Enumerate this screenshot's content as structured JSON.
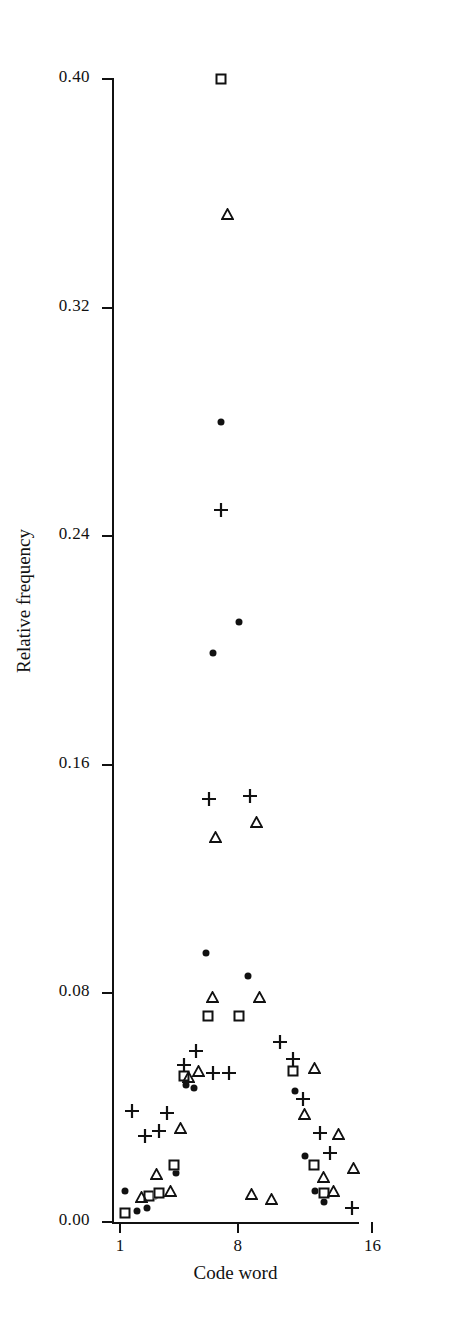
{
  "chart_data": {
    "type": "scatter",
    "title": "",
    "xlabel": "Code word",
    "ylabel": "Relative frequency",
    "xlim": [
      0,
      20
    ],
    "ylim": [
      0.0,
      0.4
    ],
    "grid": false,
    "legend": "none",
    "x_ticks": [
      {
        "value": 1,
        "label": "1"
      },
      {
        "value": 8,
        "label": "8"
      },
      {
        "value": 16,
        "label": "16"
      }
    ],
    "y_ticks": [
      {
        "value": 0.0,
        "label": "0.00"
      },
      {
        "value": 0.08,
        "label": "0.08"
      },
      {
        "value": 0.16,
        "label": "0.16"
      },
      {
        "value": 0.24,
        "label": "0.24"
      },
      {
        "value": 0.32,
        "label": "0.32"
      },
      {
        "value": 0.4,
        "label": "0.40"
      }
    ],
    "marker_types": [
      "circle",
      "square",
      "triangle",
      "plus"
    ],
    "series": [
      {
        "name": "circle",
        "marker": "circle",
        "color": "#111111",
        "points": [
          {
            "x": 1.3,
            "y": 0.011
          },
          {
            "x": 2.0,
            "y": 0.004
          },
          {
            "x": 2.6,
            "y": 0.005
          },
          {
            "x": 3.1,
            "y": 0.009
          },
          {
            "x": 4.3,
            "y": 0.017
          },
          {
            "x": 4.9,
            "y": 0.048
          },
          {
            "x": 5.4,
            "y": 0.047
          },
          {
            "x": 6.1,
            "y": 0.094
          },
          {
            "x": 6.5,
            "y": 0.199
          },
          {
            "x": 7.0,
            "y": 0.28
          },
          {
            "x": 8.1,
            "y": 0.21
          },
          {
            "x": 8.6,
            "y": 0.086
          },
          {
            "x": 11.4,
            "y": 0.046
          },
          {
            "x": 12.0,
            "y": 0.023
          },
          {
            "x": 12.6,
            "y": 0.011
          },
          {
            "x": 13.1,
            "y": 0.007
          }
        ]
      },
      {
        "name": "square",
        "marker": "square",
        "color": "#111111",
        "points": [
          {
            "x": 1.3,
            "y": 0.003
          },
          {
            "x": 2.7,
            "y": 0.009
          },
          {
            "x": 3.3,
            "y": 0.01
          },
          {
            "x": 4.2,
            "y": 0.02
          },
          {
            "x": 4.8,
            "y": 0.051
          },
          {
            "x": 6.2,
            "y": 0.072
          },
          {
            "x": 7.0,
            "y": 0.4
          },
          {
            "x": 8.1,
            "y": 0.072
          },
          {
            "x": 11.3,
            "y": 0.053
          },
          {
            "x": 12.5,
            "y": 0.02
          },
          {
            "x": 13.1,
            "y": 0.01
          }
        ]
      },
      {
        "name": "triangle",
        "marker": "triangle",
        "color": "#111111",
        "points": [
          {
            "x": 1.9,
            "y": 0.011
          },
          {
            "x": 2.8,
            "y": 0.019
          },
          {
            "x": 3.6,
            "y": 0.013
          },
          {
            "x": 4.2,
            "y": 0.035
          },
          {
            "x": 4.7,
            "y": 0.053
          },
          {
            "x": 5.3,
            "y": 0.055
          },
          {
            "x": 6.1,
            "y": 0.081
          },
          {
            "x": 6.3,
            "y": 0.137
          },
          {
            "x": 7.0,
            "y": 0.355
          },
          {
            "x": 8.4,
            "y": 0.012
          },
          {
            "x": 8.7,
            "y": 0.142
          },
          {
            "x": 8.9,
            "y": 0.081
          },
          {
            "x": 9.6,
            "y": 0.01
          },
          {
            "x": 11.6,
            "y": 0.04
          },
          {
            "x": 12.2,
            "y": 0.056
          },
          {
            "x": 12.7,
            "y": 0.018
          },
          {
            "x": 13.3,
            "y": 0.013
          },
          {
            "x": 13.6,
            "y": 0.033
          },
          {
            "x": 14.5,
            "y": 0.021
          }
        ]
      },
      {
        "name": "plus",
        "marker": "plus",
        "color": "#111111",
        "points": [
          {
            "x": 1.7,
            "y": 0.039
          },
          {
            "x": 2.5,
            "y": 0.03
          },
          {
            "x": 3.3,
            "y": 0.032
          },
          {
            "x": 3.8,
            "y": 0.038
          },
          {
            "x": 4.8,
            "y": 0.055
          },
          {
            "x": 5.5,
            "y": 0.06
          },
          {
            "x": 6.3,
            "y": 0.148
          },
          {
            "x": 6.5,
            "y": 0.052
          },
          {
            "x": 7.0,
            "y": 0.249
          },
          {
            "x": 7.5,
            "y": 0.052
          },
          {
            "x": 8.7,
            "y": 0.149
          },
          {
            "x": 10.5,
            "y": 0.063
          },
          {
            "x": 11.3,
            "y": 0.057
          },
          {
            "x": 11.9,
            "y": 0.043
          },
          {
            "x": 12.9,
            "y": 0.031
          },
          {
            "x": 13.5,
            "y": 0.024
          },
          {
            "x": 14.8,
            "y": 0.005
          }
        ]
      }
    ]
  }
}
